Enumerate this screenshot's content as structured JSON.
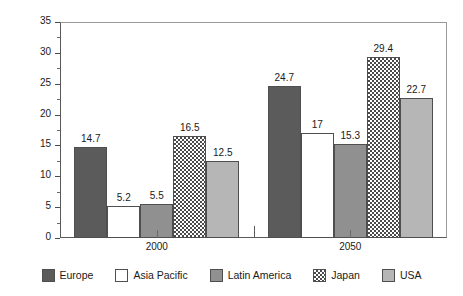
{
  "chart_data": {
    "type": "bar",
    "title": "",
    "xlabel": "",
    "ylabel": "Population over 65",
    "ylabel_unit": "%",
    "ylim": [
      0,
      35
    ],
    "yticks": [
      0,
      5,
      10,
      15,
      20,
      25,
      30,
      35
    ],
    "ytick_labels": [
      "0",
      "5",
      "10",
      "15",
      "20",
      "25",
      "30",
      "35"
    ],
    "yminor_step": 2.5,
    "grid": false,
    "legend_position": "bottom",
    "categories": [
      "2000",
      "2050"
    ],
    "series": [
      {
        "name": "Europe",
        "values": [
          14.7,
          24.7
        ],
        "labels": [
          "14.7",
          "24.7"
        ],
        "color": "#5b5b5b",
        "pattern": "solid"
      },
      {
        "name": "Asia Pacific",
        "values": [
          5.2,
          17
        ],
        "labels": [
          "5.2",
          "17"
        ],
        "color": "#ffffff",
        "pattern": "solid"
      },
      {
        "name": "Latin America",
        "values": [
          5.5,
          15.3
        ],
        "labels": [
          "5.5",
          "15.3"
        ],
        "color": "#909090",
        "pattern": "solid"
      },
      {
        "name": "Japan",
        "values": [
          16.5,
          29.4
        ],
        "labels": [
          "16.5",
          "29.4"
        ],
        "color": "#4a4a4a",
        "pattern": "checkerboard"
      },
      {
        "name": "USA",
        "values": [
          12.5,
          22.7
        ],
        "labels": [
          "12.5",
          "22.7"
        ],
        "color": "#b6b6b6",
        "pattern": "solid"
      }
    ]
  },
  "legend": {
    "items": [
      {
        "label": "Europe",
        "swatch": "europe-swatch"
      },
      {
        "label": "Asia Pacific",
        "swatch": "asia-pacific-swatch"
      },
      {
        "label": "Latin America",
        "swatch": "latin-america-swatch"
      },
      {
        "label": "Japan",
        "swatch": "japan-swatch"
      },
      {
        "label": "USA",
        "swatch": "usa-swatch"
      }
    ]
  }
}
